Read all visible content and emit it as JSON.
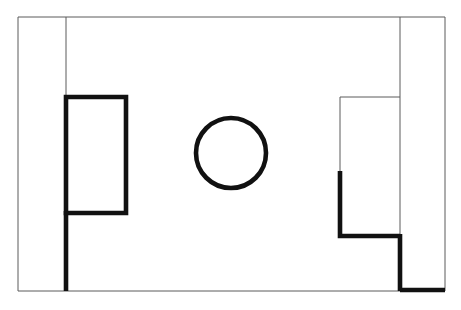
{
  "document": {
    "title": "Hand-drawn architectural line sketch",
    "kind": "line-drawing",
    "width": 461,
    "height": 310,
    "background_color": "#ffffff"
  },
  "palette": {
    "thin_line_color": "#5a5a5a",
    "thick_line_color": "#111111",
    "paper_color": "#ffffff"
  },
  "stroke_weights": {
    "thin": 1,
    "thick": 4.6
  },
  "geometry": {
    "outer_frame": {
      "label": "outer rectangle frame",
      "weight": "thin",
      "left": 18,
      "top": 17,
      "right": 445,
      "bottom": 291
    },
    "bottom_edge_thick_segment": {
      "label": "thick bottom edge right portion",
      "weight": "thick",
      "x_start": 400,
      "x_end": 445,
      "y": 290
    },
    "left_vertical_thin": {
      "label": "left thin vertical guide line",
      "weight": "thin",
      "x": 66,
      "y_start": 17,
      "y_end": 98
    },
    "left_vertical_thick": {
      "label": "left thick vertical line below rectangle",
      "weight": "thick",
      "x": 66,
      "y_start": 211,
      "y_end": 291
    },
    "left_rectangle": {
      "label": "left thick rectangle",
      "weight": "thick",
      "left": 66,
      "top": 97,
      "right": 126,
      "bottom": 213
    },
    "center_circle": {
      "label": "center circle",
      "weight": "thick",
      "center_x": 231,
      "center_y": 153,
      "radius": 35
    },
    "right_vertical_thin": {
      "label": "right thin vertical guide line",
      "weight": "thin",
      "x": 400,
      "y_start": 17,
      "y_end": 237
    },
    "right_shape_top_thin": {
      "label": "right shape thin top edge",
      "weight": "thin",
      "x_start": 340,
      "x_end": 400,
      "y": 97
    },
    "right_shape_left_thin": {
      "label": "right shape thin upper left edge",
      "weight": "thin",
      "x": 340,
      "y_start": 97,
      "y_end": 172
    },
    "right_shape_left_thick": {
      "label": "right shape thick lower left edge",
      "weight": "thick",
      "x": 340,
      "y_start": 171,
      "y_end": 238
    },
    "right_shape_bottom_thick": {
      "label": "right shape thick bottom edge",
      "weight": "thick",
      "x_start": 338,
      "x_end": 400,
      "y": 236
    },
    "right_vertical_thick": {
      "label": "right thick vertical line to bottom frame",
      "weight": "thick",
      "x": 400,
      "y_start": 234,
      "y_end": 291
    }
  }
}
